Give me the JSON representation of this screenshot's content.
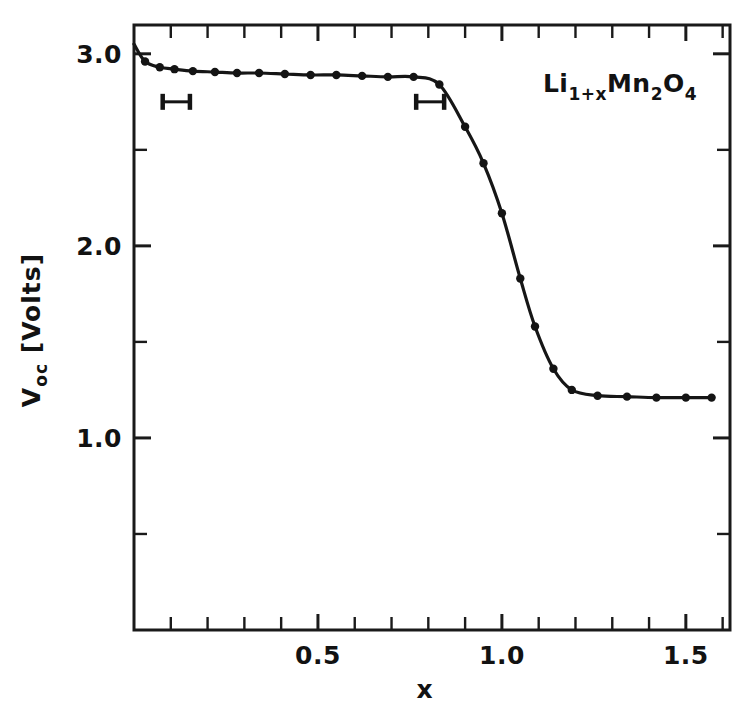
{
  "figure": {
    "background_color": "#ffffff",
    "ink_color": "#141414"
  },
  "axes": {
    "x": {
      "title": "x",
      "tick_labels": [
        "0.5",
        "1.0",
        "1.5"
      ],
      "tick_values": [
        0.5,
        1.0,
        1.5
      ],
      "range": [
        0.0,
        1.62
      ],
      "minor_tick_step": 0.1
    },
    "y": {
      "title": "V",
      "title_sub": "oc",
      "title_unit": "[Volts]",
      "title_full": "V_oc [Volts]",
      "tick_labels": [
        "3.0",
        "2.0",
        "1.0"
      ],
      "tick_values": [
        3.0,
        2.0,
        1.0
      ],
      "range": [
        0.0,
        3.15
      ],
      "minor_tick_step": 0.5
    }
  },
  "annotation": {
    "formula_parts": [
      {
        "text": "Li",
        "sub": false
      },
      {
        "text": "1+x",
        "sub": true
      },
      {
        "text": "Mn",
        "sub": false
      },
      {
        "text": "2",
        "sub": true
      },
      {
        "text": "O",
        "sub": false
      },
      {
        "text": "4",
        "sub": true
      }
    ],
    "formula_plain": "Li1+xMn2O4"
  },
  "error_bars": [
    {
      "label": "error-bar-left",
      "x_center": 0.115,
      "x_half_width": 0.037,
      "y": 2.75
    },
    {
      "label": "error-bar-right",
      "x_center": 0.805,
      "x_half_width": 0.038,
      "y": 2.75
    }
  ],
  "chart_data": {
    "type": "line",
    "title": "",
    "subtitle": "",
    "xlabel": "x",
    "ylabel": "V_oc [Volts]",
    "xlim": [
      0.0,
      1.62
    ],
    "ylim": [
      0.0,
      3.15
    ],
    "grid": false,
    "legend": "none",
    "annotations": [
      "Li1+xMn2O4"
    ],
    "series": [
      {
        "name": "Li1+xMn2O4 open-circuit voltage",
        "marker": "filled-circle",
        "line": "solid",
        "x": [
          0.0,
          0.03,
          0.07,
          0.11,
          0.16,
          0.22,
          0.28,
          0.34,
          0.41,
          0.48,
          0.55,
          0.62,
          0.69,
          0.76,
          0.83,
          0.9,
          0.95,
          1.0,
          1.05,
          1.09,
          1.14,
          1.19,
          1.26,
          1.34,
          1.42,
          1.5,
          1.57
        ],
        "y": [
          3.05,
          2.96,
          2.93,
          2.92,
          2.91,
          2.905,
          2.9,
          2.9,
          2.895,
          2.89,
          2.89,
          2.885,
          2.88,
          2.88,
          2.84,
          2.62,
          2.43,
          2.17,
          1.83,
          1.58,
          1.36,
          1.25,
          1.22,
          1.215,
          1.21,
          1.21,
          1.21
        ]
      }
    ]
  }
}
